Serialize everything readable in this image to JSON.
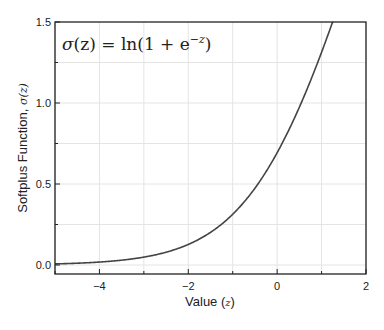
{
  "chart_data": {
    "type": "line",
    "title": "",
    "annotation": "σ(z) = ln(1 + e^{-z})",
    "annotation_parts": {
      "sigma": "σ",
      "arg": "(z) = ln(1 + e",
      "sup": "−z",
      "close": ")"
    },
    "xlabel": "Value (z)",
    "xlabel_parts": {
      "text": "Value (",
      "var": "z",
      "close": ")"
    },
    "ylabel": "Softplus Function, σ(z)",
    "ylabel_parts": {
      "text": "Softplus Function, ",
      "var": "σ(z)"
    },
    "xlim": [
      -5,
      2
    ],
    "ylim": [
      0,
      1.5
    ],
    "xticks": [
      -4,
      -2,
      0,
      2
    ],
    "xtick_labels": [
      "−4",
      "−2",
      "0",
      "2"
    ],
    "yticks": [
      0.0,
      0.5,
      1.0,
      1.5
    ],
    "ytick_labels": [
      "0.0",
      "0.5",
      "1.0",
      "1.5"
    ],
    "grid": true,
    "legend": null,
    "series": [
      {
        "name": "softplus",
        "color": "#444444",
        "x": [
          -5,
          -4.5,
          -4,
          -3.5,
          -3,
          -2.5,
          -2,
          -1.5,
          -1,
          -0.5,
          0,
          0.5,
          1,
          1.26
        ],
        "y": [
          0.0067,
          0.011,
          0.018,
          0.03,
          0.049,
          0.079,
          0.127,
          0.201,
          0.313,
          0.474,
          0.693,
          0.974,
          1.313,
          1.5
        ]
      }
    ]
  }
}
